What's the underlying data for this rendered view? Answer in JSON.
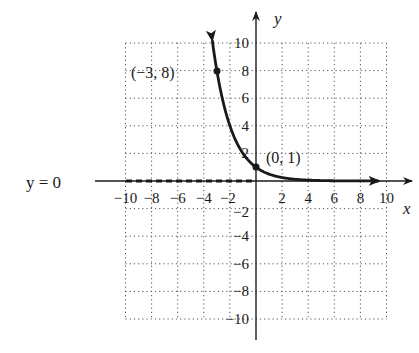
{
  "chart_data": {
    "type": "line",
    "title": "",
    "xlabel": "x",
    "ylabel": "y",
    "xlim": [
      -10,
      10
    ],
    "ylim": [
      -10,
      10
    ],
    "grid": true,
    "grid_style": "dotted",
    "x_ticks": [
      -10,
      -8,
      -6,
      -4,
      -2,
      2,
      4,
      6,
      8,
      10
    ],
    "y_ticks": [
      -10,
      -8,
      -6,
      -4,
      -2,
      2,
      4,
      6,
      8,
      10
    ],
    "x_tick_labels": [
      "−10",
      "−8",
      "−6",
      "−4",
      "−2",
      "2",
      "4",
      "6",
      "8",
      "10"
    ],
    "y_tick_labels": [
      "−10",
      "−8",
      "−6",
      "−4",
      "−2",
      "2",
      "4",
      "6",
      "8",
      "10"
    ],
    "series": [
      {
        "name": "y = (1/2)^x",
        "function": "y = (1/2)^x",
        "x": [
          -3.3,
          -3,
          -2,
          -1,
          0,
          1,
          2,
          3,
          4,
          6,
          8,
          9.3
        ],
        "y": [
          9.85,
          8,
          4,
          2,
          1,
          0.5,
          0.25,
          0.125,
          0.0625,
          0.016,
          0.004,
          0.0016
        ],
        "arrows": [
          "start",
          "end"
        ]
      }
    ],
    "points": [
      {
        "x": -3,
        "y": 8,
        "label": "(−3, 8)"
      },
      {
        "x": 0,
        "y": 1,
        "label": "(0, 1)"
      }
    ],
    "asymptote": {
      "type": "horizontal",
      "y": 0,
      "label": "y = 0",
      "style": "dashed"
    }
  },
  "labels": {
    "x_axis": "x",
    "y_axis": "y",
    "asymptote": "y = 0",
    "point_a": "(−3, 8)",
    "point_b": "(0, 1)"
  },
  "ticks": {
    "x": [
      "−10",
      "−8",
      "−6",
      "−4",
      "−2",
      "2",
      "4",
      "6",
      "8",
      "10"
    ],
    "y_pos": [
      "10",
      "8",
      "6",
      "4"
    ],
    "y_two": "2",
    "y_neg_two": "−2",
    "y_neg": [
      "−4",
      "−6",
      "−8",
      "−10"
    ]
  }
}
